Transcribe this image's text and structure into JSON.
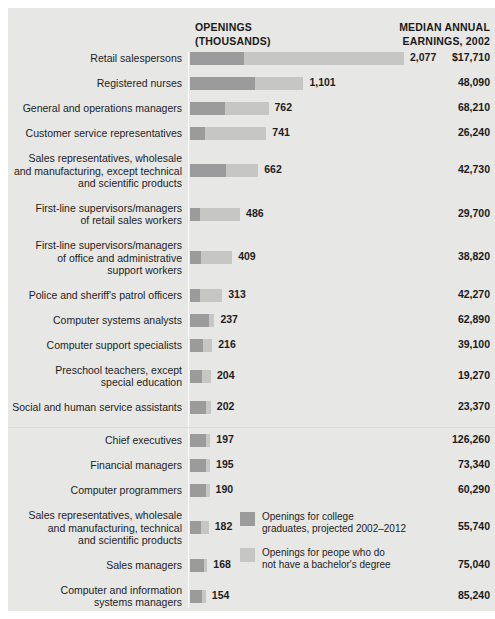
{
  "header": {
    "openings_label": "OPENINGS\n(THOUSANDS)",
    "openings_line1": "OPENINGS",
    "openings_line2": "(THOUSANDS)",
    "earnings_line1": "MEDIAN ANNUAL",
    "earnings_line2": "EARNINGS, 2002"
  },
  "legend": {
    "items": [
      {
        "color": "#9b9b9b",
        "line1": "Openings for college",
        "line2": "graduates, projected 2002–2012"
      },
      {
        "color": "#c6c6c4",
        "line1": "Openings for peope who do",
        "line2": "not have a bachelor's degree"
      }
    ]
  },
  "colors": {
    "background": "#e7e7e5",
    "page": "#ffffff",
    "bar_college": "#9b9b9b",
    "bar_noncollege": "#c6c6c4",
    "text": "#1d1d1d",
    "axis_rule": "#ffffff"
  },
  "chart_data": {
    "type": "bar",
    "subtype": "stacked-horizontal",
    "title": "",
    "xlabel": "Openings (thousands)",
    "ylabel": "",
    "grid": false,
    "legend_position": "inside-bottom-right",
    "columns": [
      "Occupation",
      "Openings (thousands)",
      "Median annual earnings, 2002"
    ],
    "series": [
      {
        "name": "Openings for college graduates, projected 2002–2012",
        "color": "#9b9b9b"
      },
      {
        "name": "Openings for peope who do not have a bachelor's degree",
        "color": "#c6c6c4"
      }
    ],
    "xlim": [
      0,
      2077
    ],
    "rows": [
      {
        "label_lines": [
          "Retail salespersons"
        ],
        "openings": 2077,
        "openings_text": "2,077",
        "college": 520,
        "noncollege": 1557,
        "earnings_text": "$17,710",
        "earnings": 17710,
        "group": 1
      },
      {
        "label_lines": [
          "Registered nurses"
        ],
        "openings": 1101,
        "openings_text": "1,101",
        "college": 633,
        "noncollege": 468,
        "earnings_text": "48,090",
        "earnings": 48090,
        "group": 1
      },
      {
        "label_lines": [
          "General and operations managers"
        ],
        "openings": 762,
        "openings_text": "762",
        "college": 344,
        "noncollege": 418,
        "earnings_text": "68,210",
        "earnings": 68210,
        "group": 1
      },
      {
        "label_lines": [
          "Customer service representatives"
        ],
        "openings": 741,
        "openings_text": "741",
        "college": 148,
        "noncollege": 593,
        "earnings_text": "26,240",
        "earnings": 26240,
        "group": 1
      },
      {
        "label_lines": [
          "Sales representatives, wholesale",
          "and manufacturing, except technical",
          "and scientific products"
        ],
        "openings": 662,
        "openings_text": "662",
        "college": 354,
        "noncollege": 308,
        "earnings_text": "42,730",
        "earnings": 42730,
        "group": 1
      },
      {
        "label_lines": [
          "First-line supervisors/managers",
          "of retail sales workers"
        ],
        "openings": 486,
        "openings_text": "486",
        "college": 98,
        "noncollege": 388,
        "earnings_text": "29,700",
        "earnings": 29700,
        "group": 1
      },
      {
        "label_lines": [
          "First-line supervisors/managers",
          "of office and administrative",
          "support workers"
        ],
        "openings": 409,
        "openings_text": "409",
        "college": 111,
        "noncollege": 298,
        "earnings_text": "38,820",
        "earnings": 38820,
        "group": 1
      },
      {
        "label_lines": [
          "Police and sheriff's patrol officers"
        ],
        "openings": 313,
        "openings_text": "313",
        "college": 94,
        "noncollege": 219,
        "earnings_text": "42,270",
        "earnings": 42270,
        "group": 1
      },
      {
        "label_lines": [
          "Computer systems analysts"
        ],
        "openings": 237,
        "openings_text": "237",
        "college": 180,
        "noncollege": 57,
        "earnings_text": "62,890",
        "earnings": 62890,
        "group": 1
      },
      {
        "label_lines": [
          "Computer support specialists"
        ],
        "openings": 216,
        "openings_text": "216",
        "college": 130,
        "noncollege": 86,
        "earnings_text": "39,100",
        "earnings": 39100,
        "group": 1
      },
      {
        "label_lines": [
          "Preschool teachers, except",
          "special education"
        ],
        "openings": 204,
        "openings_text": "204",
        "college": 120,
        "noncollege": 84,
        "earnings_text": "19,270",
        "earnings": 19270,
        "group": 1
      },
      {
        "label_lines": [
          "Social and human service assistants"
        ],
        "openings": 202,
        "openings_text": "202",
        "college": 152,
        "noncollege": 50,
        "earnings_text": "23,370",
        "earnings": 23370,
        "group": 1
      },
      {
        "label_lines": [
          "Chief executives"
        ],
        "openings": 197,
        "openings_text": "197",
        "college": 160,
        "noncollege": 37,
        "earnings_text": "126,260",
        "earnings": 126260,
        "group": 2
      },
      {
        "label_lines": [
          "Financial managers"
        ],
        "openings": 195,
        "openings_text": "195",
        "college": 152,
        "noncollege": 43,
        "earnings_text": "73,340",
        "earnings": 73340,
        "group": 2
      },
      {
        "label_lines": [
          "Computer programmers"
        ],
        "openings": 190,
        "openings_text": "190",
        "college": 152,
        "noncollege": 38,
        "earnings_text": "60,290",
        "earnings": 60290,
        "group": 2
      },
      {
        "label_lines": [
          "Sales representatives, wholesale",
          "and manufacturing, technical",
          "and scientific products"
        ],
        "openings": 182,
        "openings_text": "182",
        "college": 110,
        "noncollege": 72,
        "earnings_text": "55,740",
        "earnings": 55740,
        "group": 2
      },
      {
        "label_lines": [
          "Sales managers"
        ],
        "openings": 168,
        "openings_text": "168",
        "college": 132,
        "noncollege": 36,
        "earnings_text": "75,040",
        "earnings": 75040,
        "group": 2
      },
      {
        "label_lines": [
          "Computer and information",
          "systems managers"
        ],
        "openings": 154,
        "openings_text": "154",
        "college": 120,
        "noncollege": 34,
        "earnings_text": "85,240",
        "earnings": 85240,
        "group": 2
      },
      {
        "label_lines": [
          "Network systems and data",
          "communications analysts"
        ],
        "openings": 128,
        "openings_text": "128",
        "college": 96,
        "noncollege": 32,
        "earnings_text": "58,420",
        "earnings": 58420,
        "group": 2
      },
      {
        "label_lines": [
          "Medical and health",
          "services managers"
        ],
        "openings": 119,
        "openings_text": "119",
        "college": 92,
        "noncollege": 27,
        "earnings_text": "61,370",
        "earnings": 61370,
        "group": 2
      }
    ]
  }
}
